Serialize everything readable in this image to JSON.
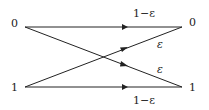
{
  "diagram": {
    "inputs": [
      {
        "label": "0"
      },
      {
        "label": "1"
      }
    ],
    "outputs": [
      {
        "label": "0"
      },
      {
        "label": "1"
      }
    ],
    "edges": [
      {
        "from": "0",
        "to": "0",
        "label": "1−ε"
      },
      {
        "from": "1",
        "to": "0",
        "label": "ε"
      },
      {
        "from": "0",
        "to": "1",
        "label": "ε"
      },
      {
        "from": "1",
        "to": "1",
        "label": "1−ε"
      }
    ],
    "colors": {
      "line": "#222222",
      "background": "#ffffff"
    }
  }
}
